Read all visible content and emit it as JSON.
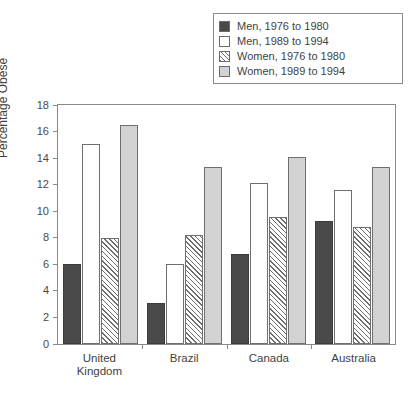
{
  "legend": {
    "position": "top-right",
    "items": [
      {
        "label": "Men, 1976 to 1980",
        "swatch": "solid-dark-square-icon",
        "color": "#4a4a4a"
      },
      {
        "label": "Men, 1989 to 1994",
        "swatch": "open-white-square-icon",
        "color": "#ffffff"
      },
      {
        "label": "Women, 1976 to 1980",
        "swatch": "hatched-square-icon",
        "color": "#ffffff"
      },
      {
        "label": "Women, 1989 to 1994",
        "swatch": "solid-light-square-icon",
        "color": "#d2d2d2"
      }
    ]
  },
  "axis": {
    "y_label": "Percentage Obese",
    "y_ticks": [
      "0",
      "2",
      "4",
      "6",
      "8",
      "10",
      "12",
      "14",
      "16",
      "18"
    ]
  },
  "caption": "",
  "chart_data": {
    "type": "bar",
    "title": "",
    "xlabel": "",
    "ylabel": "Percentage Obese",
    "ylim": [
      0,
      18
    ],
    "ytick_step": 2,
    "grid": false,
    "legend_position": "top-right",
    "categories": [
      "United Kingdom",
      "Brazil",
      "Canada",
      "Australia"
    ],
    "category_lines": [
      [
        "United",
        "Kingdom"
      ],
      [
        "Brazil"
      ],
      [
        "Canada"
      ],
      [
        "Australia"
      ]
    ],
    "series": [
      {
        "name": "Men, 1976 to 1980",
        "style": "solid-dark",
        "color": "#4a4a4a",
        "values": [
          6.0,
          3.1,
          6.8,
          9.3
        ]
      },
      {
        "name": "Men, 1989 to 1994",
        "style": "open-white",
        "color": "#ffffff",
        "values": [
          15.1,
          6.0,
          12.1,
          11.6
        ]
      },
      {
        "name": "Women, 1976 to 1980",
        "style": "hatched",
        "color": "#ffffff",
        "values": [
          8.0,
          8.2,
          9.6,
          8.8
        ]
      },
      {
        "name": "Women, 1989 to 1994",
        "style": "solid-light",
        "color": "#d2d2d2",
        "values": [
          16.5,
          13.3,
          14.1,
          13.3
        ]
      }
    ]
  }
}
